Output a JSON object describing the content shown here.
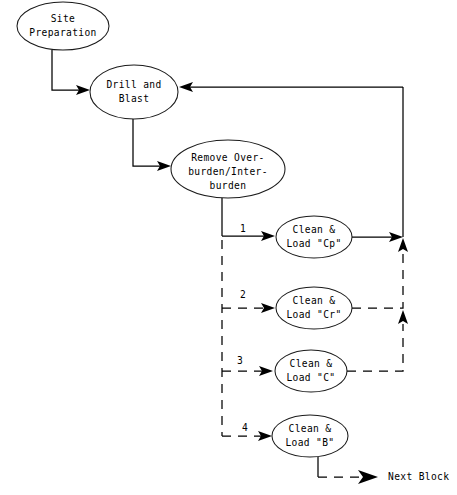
{
  "diagram": {
    "background_color": "#ffffff",
    "line_color": "#000000",
    "nodes": [
      {
        "id": "site-preparation",
        "label_lines": [
          "Site",
          "Preparation"
        ],
        "cx": 63,
        "cy": 26,
        "rx": 46,
        "ry": 24
      },
      {
        "id": "drill-and-blast",
        "label_lines": [
          "Drill and",
          "Blast"
        ],
        "cx": 134,
        "cy": 92,
        "rx": 44,
        "ry": 27
      },
      {
        "id": "remove-overburden",
        "label_lines": [
          "Remove Over-",
          "burden/Inter-",
          "burden"
        ],
        "cx": 228,
        "cy": 169,
        "rx": 57,
        "ry": 29
      },
      {
        "id": "clean-load-cp",
        "label_lines": [
          "Clean &",
          "Load \"Cp\""
        ],
        "cx": 314,
        "cy": 237,
        "rx": 38,
        "ry": 21
      },
      {
        "id": "clean-load-cr",
        "label_lines": [
          "Clean &",
          "Load \"Cr\""
        ],
        "cx": 314,
        "cy": 308,
        "rx": 38,
        "ry": 21
      },
      {
        "id": "clean-load-c",
        "label_lines": [
          "Clean &",
          "Load \"C\""
        ],
        "cx": 311,
        "cy": 371,
        "rx": 36,
        "ry": 21
      },
      {
        "id": "clean-load-b",
        "label_lines": [
          "Clean &",
          "Load \"B\""
        ],
        "cx": 310,
        "cy": 436,
        "rx": 38,
        "ry": 21
      }
    ],
    "edge_labels": [
      {
        "id": "branch-label-1",
        "text": "1",
        "x": 243,
        "y": 232
      },
      {
        "id": "branch-label-2",
        "text": "2",
        "x": 243,
        "y": 298
      },
      {
        "id": "branch-label-3",
        "text": "3",
        "x": 240,
        "y": 364
      },
      {
        "id": "branch-label-4",
        "text": "4",
        "x": 245,
        "y": 431
      }
    ],
    "terminal": {
      "id": "next-block",
      "text": "Next Block",
      "x": 388,
      "y": 477
    }
  }
}
